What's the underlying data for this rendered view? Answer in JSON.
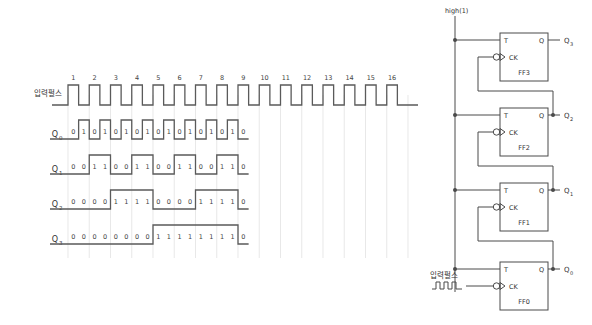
{
  "figure": {
    "type": "timing-diagram-with-schematic"
  },
  "timing": {
    "clock_label": "입력펄스",
    "tick_numbers": [
      1,
      2,
      3,
      4,
      5,
      6,
      7,
      8,
      9,
      10,
      11,
      12,
      13,
      14,
      15,
      16
    ],
    "rows": [
      {
        "name": "Q0",
        "label": "Q",
        "subscript": "0",
        "values": [
          0,
          1,
          0,
          1,
          0,
          1,
          0,
          1,
          0,
          1,
          0,
          1,
          0,
          1,
          0,
          1,
          0
        ]
      },
      {
        "name": "Q1",
        "label": "Q",
        "subscript": "1",
        "values": [
          0,
          0,
          1,
          1,
          0,
          0,
          1,
          1,
          0,
          0,
          1,
          1,
          0,
          0,
          1,
          1,
          0
        ]
      },
      {
        "name": "Q2",
        "label": "Q",
        "subscript": "2",
        "values": [
          0,
          0,
          0,
          0,
          1,
          1,
          1,
          1,
          0,
          0,
          0,
          0,
          1,
          1,
          1,
          1,
          0
        ]
      },
      {
        "name": "Q3",
        "label": "Q",
        "subscript": "3",
        "values": [
          0,
          0,
          0,
          0,
          0,
          0,
          0,
          0,
          1,
          1,
          1,
          1,
          1,
          1,
          1,
          1,
          0
        ]
      }
    ]
  },
  "schematic": {
    "supply_label": "high(1)",
    "input_label": "입력펄스",
    "flipflops": [
      {
        "name": "FF3",
        "t_pin": "T",
        "q_pin": "Q",
        "ck_pin": "CK",
        "output": "Q",
        "output_sub": "3"
      },
      {
        "name": "FF2",
        "t_pin": "T",
        "q_pin": "Q",
        "ck_pin": "CK",
        "output": "Q",
        "output_sub": "2"
      },
      {
        "name": "FF1",
        "t_pin": "T",
        "q_pin": "Q",
        "ck_pin": "CK",
        "output": "Q",
        "output_sub": "1"
      },
      {
        "name": "FF0",
        "t_pin": "T",
        "q_pin": "Q",
        "ck_pin": "CK",
        "output": "Q",
        "output_sub": "0"
      }
    ]
  },
  "colors": {
    "background": "#ffffff",
    "wire": "#4a4a4a",
    "waveform": "#5a5a5a",
    "guide": "#d8d8d8",
    "text": "#3a3a3a"
  }
}
